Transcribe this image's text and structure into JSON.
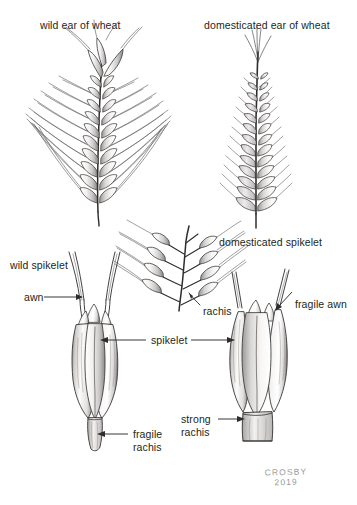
{
  "figure": {
    "title_wild": "wild ear of wheat",
    "title_domesticated": "domesticated ear of wheat",
    "background_color": "#ffffff",
    "ink_color": "#231f20",
    "signature_color": "#9a9a9a"
  },
  "labels": {
    "wild_ear": "wild ear of wheat",
    "domesticated_ear": "domesticated ear of wheat",
    "wild_spikelet": "wild spikelet",
    "domesticated_spikelet": "domesticated spikelet",
    "awn": "awn",
    "fragile_awn": "fragile awn",
    "rachis": "rachis",
    "spikelet": "spikelet",
    "fragile_rachis_line1": "fragile",
    "fragile_rachis_line2": "rachis",
    "strong_rachis_line1": "strong",
    "strong_rachis_line2": "rachis"
  },
  "signature": {
    "artist": "CROSBY",
    "year": "2019"
  }
}
